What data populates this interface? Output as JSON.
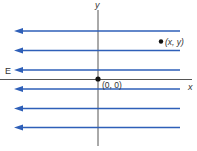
{
  "diagram": {
    "field_label": "E",
    "axis_x_label": "x",
    "axis_y_label": "y",
    "origin_label": "(0, 0)",
    "point_label": "(x, y)",
    "field_lines": [
      {
        "y": 31
      },
      {
        "y": 50
      },
      {
        "y": 70
      },
      {
        "y": 89
      },
      {
        "y": 108
      },
      {
        "y": 127
      }
    ],
    "field_direction": "negative-x",
    "colors": {
      "field_line": "#2e5fb8",
      "axis": "#555555",
      "text": "#333333",
      "dot": "#111111"
    }
  }
}
